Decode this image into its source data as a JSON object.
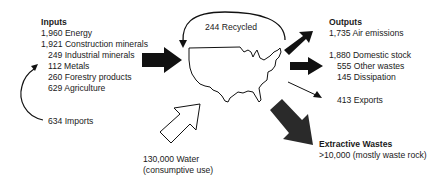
{
  "inputs": {
    "heading": "Inputs",
    "items": [
      {
        "value": "1,960",
        "label": "Energy"
      },
      {
        "value": "1,921",
        "label": "Construction minerals"
      },
      {
        "value": "249",
        "label": "Industrial minerals"
      },
      {
        "value": "112",
        "label": "Metals"
      },
      {
        "value": "260",
        "label": "Forestry products"
      },
      {
        "value": "629",
        "label": "Agriculture"
      }
    ],
    "lines": [
      "1,960 Energy",
      "1,921 Construction minerals",
      "249 Industrial minerals",
      "112 Metals",
      "260 Forestry products",
      "629 Agriculture"
    ]
  },
  "imports": {
    "text": "634 Imports",
    "value": "634"
  },
  "recycled": {
    "text": "244 Recycled",
    "value": "244"
  },
  "water": {
    "line1": "130,000 Water",
    "line2": "(consumptive use)",
    "value": "130,000"
  },
  "outputs": {
    "heading": "Outputs",
    "air": "1,735 Air emissions",
    "domestic_stock": "1,880 Domestic stock",
    "other_wastes": "555 Other wastes",
    "dissipation": "145 Dissipation",
    "exports": "413 Exports"
  },
  "extractive_wastes": {
    "heading": "Extractive Wastes",
    "text": ">10,000 (mostly waste rock)"
  },
  "colors": {
    "text": "#1a1a1a",
    "arrow_fill": "#111111",
    "extractive_arrow_fill": "#2a2a2a",
    "water_arrow_fill": "#ffffff"
  }
}
